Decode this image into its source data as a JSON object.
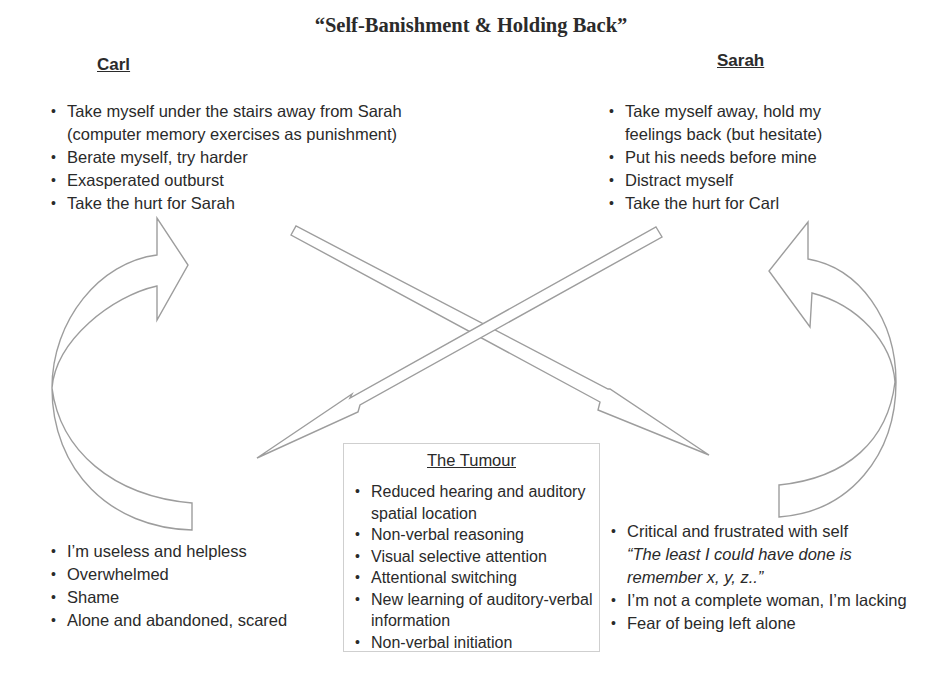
{
  "title": "“Self-Banishment & Holding Back”",
  "carl": {
    "heading": "Carl",
    "behaviours": [
      "Take myself under the stairs away from Sarah (computer memory exercises as punishment)",
      "Berate myself, try harder",
      "Exasperated outburst",
      "Take the hurt for Sarah"
    ],
    "feelings": [
      "I’m useless and helpless",
      "Overwhelmed",
      "Shame",
      "Alone and abandoned, scared"
    ]
  },
  "sarah": {
    "heading": "Sarah",
    "behaviours": [
      "Take myself away, hold my feelings back (but hesitate)",
      "Put his needs before mine",
      "Distract myself",
      "Take the hurt for Carl"
    ],
    "feelings": {
      "item1": "Critical and frustrated with self",
      "item1_quote": "“The least I could have done is remember x, y, z..”",
      "item2": "I’m not a complete woman, I’m lacking",
      "item3": "Fear of being left alone"
    }
  },
  "tumour": {
    "heading": "The Tumour",
    "items": [
      "Reduced hearing and auditory spatial location",
      "Non-verbal reasoning",
      "Visual selective attention",
      "Attentional switching",
      "New learning of auditory-verbal information",
      "Non-verbal initiation"
    ]
  },
  "colors": {
    "text": "#2a2a2a",
    "arrow_outline": "#9d9d9d",
    "box_border": "#cfcfcf",
    "background": "#ffffff"
  }
}
